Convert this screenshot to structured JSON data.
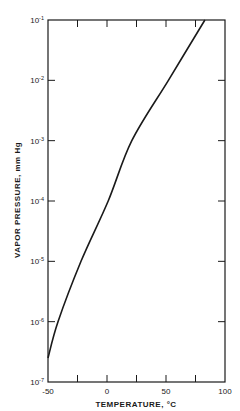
{
  "chart_data": {
    "type": "line",
    "title": "",
    "xlabel": "TEMPERATURE, °C",
    "ylabel": "VAPOR PRESSURE, mm Hg",
    "xscale": "linear",
    "yscale": "log",
    "xlim": [
      -50,
      100
    ],
    "ylim": [
      1e-07,
      0.1
    ],
    "x_ticks": [
      -50,
      -25,
      0,
      25,
      50,
      75,
      100
    ],
    "x_tick_labels": [
      "-50",
      "",
      "0",
      "",
      "50",
      "",
      "100"
    ],
    "y_ticks": [
      1e-07,
      1e-06,
      1e-05,
      0.0001,
      0.001,
      0.01,
      0.1
    ],
    "y_tick_labels": [
      {
        "base": "10",
        "exp": "-7"
      },
      {
        "base": "10",
        "exp": "-6"
      },
      {
        "base": "10",
        "exp": "-5"
      },
      {
        "base": "10",
        "exp": "-4"
      },
      {
        "base": "10",
        "exp": "-3"
      },
      {
        "base": "10",
        "exp": "-2"
      },
      {
        "base": "10",
        "exp": "-1"
      }
    ],
    "grid": false,
    "legend": null,
    "series": [
      {
        "name": "vapor pressure",
        "x": [
          -50,
          -41.5,
          -22,
          1,
          21,
          52,
          83
        ],
        "y": [
          2.5e-07,
          1e-06,
          1e-05,
          0.0001,
          0.001,
          0.01,
          0.1
        ]
      }
    ]
  },
  "colors": {
    "line": "#1a1a1a",
    "axis": "#1a1a1a",
    "background": "#ffffff"
  }
}
